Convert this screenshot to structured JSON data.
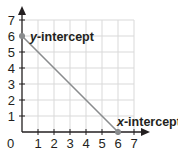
{
  "chart_data": {
    "type": "line",
    "title": "",
    "xlabel": "",
    "ylabel": "",
    "xlim": [
      0,
      7
    ],
    "ylim": [
      0,
      7
    ],
    "grid": true,
    "x_ticks": [
      "0",
      "1",
      "2",
      "3",
      "4",
      "5",
      "6",
      "7"
    ],
    "y_ticks": [
      "1",
      "2",
      "3",
      "4",
      "5",
      "6",
      "7"
    ],
    "series": [
      {
        "name": "line",
        "x": [
          0,
          6
        ],
        "y": [
          6,
          0
        ],
        "color": "#8a8c8e"
      }
    ],
    "points": [
      {
        "x": 0,
        "y": 6,
        "label": "y-intercept"
      },
      {
        "x": 6,
        "y": 0,
        "label": "x-intercept"
      }
    ],
    "annotations": [
      {
        "text_italic": "y",
        "text": "-intercept",
        "at": [
          0,
          6
        ]
      },
      {
        "text_italic": "x",
        "text": "-intercept",
        "at": [
          6,
          0
        ]
      }
    ]
  },
  "labels": {
    "origin": "0",
    "y_intercept_var": "y",
    "y_intercept_rest": "-intercept",
    "x_intercept_var": "x",
    "x_intercept_rest": "-intercept"
  },
  "colors": {
    "axis": "#231f20",
    "grid": "#d9d9d9",
    "line": "#8a8c8e",
    "point": "#8a8c8e"
  }
}
